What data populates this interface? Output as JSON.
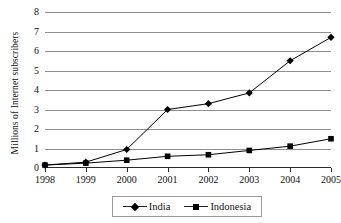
{
  "chart_data": {
    "type": "line",
    "title": "",
    "xlabel": "",
    "ylabel": "Millions of Internet subscribers",
    "categories": [
      "1998",
      "1999",
      "2000",
      "2001",
      "2002",
      "2003",
      "2004",
      "2005"
    ],
    "ylim": [
      0,
      8
    ],
    "ytick_labels": [
      "0",
      "1",
      "2",
      "3",
      "4",
      "5",
      "6",
      "7",
      "8"
    ],
    "ytick_values": [
      0,
      1,
      2,
      3,
      4,
      5,
      6,
      7,
      8
    ],
    "grid": true,
    "legend_position": "bottom",
    "series": [
      {
        "name": "India",
        "marker": "diamond",
        "color": "#000000",
        "values": [
          0.15,
          0.3,
          0.95,
          3.0,
          3.3,
          3.85,
          5.5,
          6.7
        ]
      },
      {
        "name": "Indonesia",
        "marker": "square",
        "color": "#000000",
        "values": [
          0.15,
          0.25,
          0.4,
          0.6,
          0.68,
          0.9,
          1.12,
          1.5
        ]
      }
    ]
  },
  "legend": {
    "entries": [
      {
        "label": "India",
        "marker": "diamond"
      },
      {
        "label": "Indonesia",
        "marker": "square"
      }
    ]
  },
  "colors": {
    "gridline": "#8f8f8f",
    "axis": "#2a2a2a",
    "series": "#000000",
    "background": "#ffffff"
  }
}
